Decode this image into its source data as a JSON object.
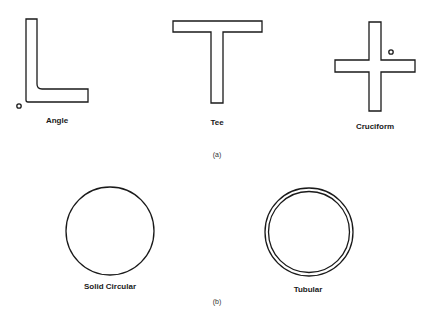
{
  "figure": {
    "part_a": {
      "caption": "(a)",
      "shapes": [
        {
          "name": "angle",
          "label": "Angle"
        },
        {
          "name": "tee",
          "label": "Tee"
        },
        {
          "name": "cruciform",
          "label": "Cruciform"
        }
      ]
    },
    "part_b": {
      "caption": "(b)",
      "shapes": [
        {
          "name": "solid-circular",
          "label": "Solid Circular"
        },
        {
          "name": "tubular",
          "label": "Tubular"
        }
      ]
    },
    "stroke_color": "#1a1a1a"
  }
}
